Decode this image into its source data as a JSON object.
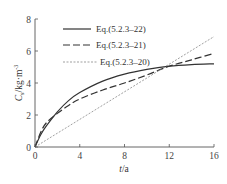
{
  "chart_data": {
    "type": "line",
    "title": "",
    "xlabel": "t/a",
    "ylabel": "C_s/kg·m^-3",
    "ylabel_main": "C",
    "ylabel_sub": "s",
    "ylabel_unit": "/kg·m",
    "ylabel_sup": "-3",
    "xlabel_italic": "t",
    "xlabel_unit": "/a",
    "xlim": [
      0,
      16
    ],
    "ylim": [
      0,
      8
    ],
    "xticks": [
      0,
      4,
      8,
      12,
      16
    ],
    "yticks": [
      0,
      2,
      4,
      6,
      8
    ],
    "grid": false,
    "legend_position": "upper-left-inside",
    "series": [
      {
        "name": "Eq.(5.2.3–22)",
        "style": "solid",
        "x": [
          0,
          0.5,
          1,
          2,
          3,
          4,
          6,
          8,
          10,
          12,
          14,
          16
        ],
        "values": [
          0,
          0.75,
          1.3,
          2.2,
          2.9,
          3.4,
          4.1,
          4.55,
          4.85,
          5.05,
          5.15,
          5.2
        ]
      },
      {
        "name": "Eq.(5.2.3–21)",
        "style": "dashed",
        "x": [
          0,
          0.5,
          1,
          2,
          3,
          4,
          6,
          8,
          10,
          12,
          14,
          16
        ],
        "values": [
          0,
          0.9,
          1.5,
          2.1,
          2.6,
          3.0,
          3.55,
          4.0,
          4.5,
          5.05,
          5.45,
          5.85
        ]
      },
      {
        "name": "Eq.(5.2.3–20)",
        "style": "dotted",
        "x": [
          0,
          16
        ],
        "values": [
          0,
          6.9
        ]
      }
    ]
  },
  "colors": {
    "axis": "#555555",
    "line": "#333333"
  }
}
